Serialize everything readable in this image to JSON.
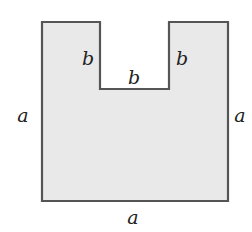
{
  "diagram": {
    "type": "geometric-figure",
    "shape": {
      "fill": "#e9e9e9",
      "stroke": "#555555",
      "outer_side": "a",
      "notch_side": "b"
    },
    "labels": {
      "notch_left": "b",
      "notch_bottom": "b",
      "notch_right": "b",
      "left_side": "a",
      "right_side": "a",
      "bottom_side": "a"
    }
  }
}
